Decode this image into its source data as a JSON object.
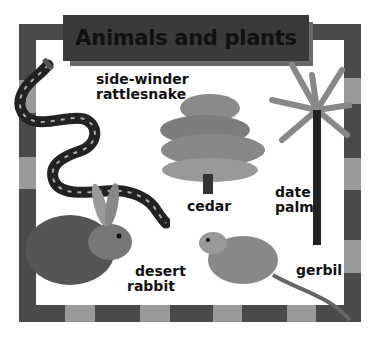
{
  "title": "Animals and plants",
  "labels": {
    "snake": [
      "side-winder",
      "rattlesnake"
    ],
    "cedar": "cedar",
    "palm": [
      "date",
      "palm"
    ],
    "rabbit": [
      "desert",
      "rabbit"
    ],
    "gerbil": "gerbil"
  },
  "organisms": [
    {
      "name": "side-winder rattlesnake",
      "type": "animal"
    },
    {
      "name": "cedar",
      "type": "plant"
    },
    {
      "name": "date palm",
      "type": "plant"
    },
    {
      "name": "desert rabbit",
      "type": "animal"
    },
    {
      "name": "gerbil",
      "type": "animal"
    }
  ],
  "colors": {
    "frame_dark": "#4a4a4a",
    "frame_light": "#9a9a9a",
    "banner": "#3a3a3a"
  }
}
